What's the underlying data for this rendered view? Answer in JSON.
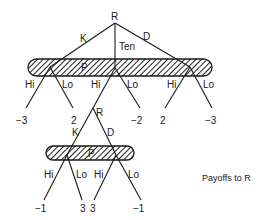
{
  "diagram": {
    "type": "game-tree",
    "caption": "Payoffs to R",
    "upper": {
      "root_player": "R",
      "root_actions": [
        "K",
        "Ten",
        "D"
      ],
      "info_set_player": "P",
      "branch_actions": [
        "Hi",
        "Lo",
        "Hi",
        "Lo",
        "Hi",
        "Lo"
      ],
      "payoffs": [
        "−3",
        "2",
        "−2",
        "2",
        "−3"
      ]
    },
    "lower": {
      "root_player": "R",
      "root_actions": [
        "K",
        "D"
      ],
      "info_set_player": "P",
      "branch_actions": [
        "Hi",
        "Lo",
        "Hi",
        "Lo"
      ],
      "payoffs": [
        "−1",
        "3",
        "3",
        "−1"
      ]
    }
  }
}
